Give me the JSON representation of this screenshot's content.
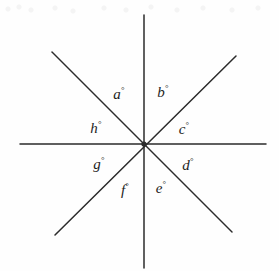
{
  "figure": {
    "background_color": "#fefefe",
    "line_color": "#2b2b2b",
    "label_color": "#1d1d1d",
    "width": 279,
    "height": 271
  },
  "geometry": {
    "center": {
      "x": 144,
      "y": 144
    },
    "lines": [
      {
        "name": "horizontal-line",
        "x1": 20,
        "y1": 144,
        "x2": 266,
        "y2": 144
      },
      {
        "name": "vertical-line",
        "x1": 144,
        "y1": 15,
        "x2": 144,
        "y2": 268
      },
      {
        "name": "diagonal-nw-se-line",
        "x1": 52,
        "y1": 52,
        "x2": 232,
        "y2": 232
      },
      {
        "name": "diagonal-ne-sw-line",
        "x1": 236,
        "y1": 56,
        "x2": 55,
        "y2": 235
      }
    ]
  },
  "labels": [
    {
      "id": "a",
      "letter": "a",
      "degree": "°",
      "x": 119,
      "y": 94
    },
    {
      "id": "b",
      "letter": "b",
      "degree": "°",
      "x": 163,
      "y": 92
    },
    {
      "id": "c",
      "letter": "c",
      "degree": "°",
      "x": 184,
      "y": 129
    },
    {
      "id": "d",
      "letter": "d",
      "degree": "°",
      "x": 188,
      "y": 165
    },
    {
      "id": "e",
      "letter": "e",
      "degree": "°",
      "x": 161,
      "y": 188
    },
    {
      "id": "f",
      "letter": "f",
      "degree": "°",
      "x": 125,
      "y": 190
    },
    {
      "id": "g",
      "letter": "g",
      "degree": "°",
      "x": 99,
      "y": 164
    },
    {
      "id": "h",
      "letter": "h",
      "degree": "°",
      "x": 96,
      "y": 128
    }
  ],
  "chart_data": {
    "type": "diagram",
    "ray_count": 8,
    "line_count": 4,
    "angle_labels": [
      "a°",
      "b°",
      "c°",
      "d°",
      "e°",
      "f°",
      "g°",
      "h°"
    ],
    "label_order_clockwise_from_upper_left": [
      "a",
      "b",
      "c",
      "d",
      "e",
      "f",
      "g",
      "h"
    ]
  }
}
